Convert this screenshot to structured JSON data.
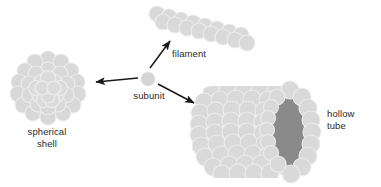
{
  "figure": {
    "background_color": "#ffffff",
    "subunit_fill": "#d9d9d9",
    "subunit_stroke": "#e9e9e9",
    "tube_interior_color": "#8a8a8a",
    "arrow_color": "#1a1a1a",
    "text_color": "#2b2b2b"
  },
  "labels": {
    "spherical_shell": "spherical\nshell",
    "filament": "filament",
    "subunit": "subunit",
    "hollow_tube": "hollow\ntube"
  },
  "structures": {
    "subunit": {
      "name": "subunit",
      "shape": "single circle",
      "center": [
        148,
        79
      ],
      "radius": 7
    },
    "spherical_shell": {
      "name": "spherical shell",
      "shape": "dense sphere cluster of circles",
      "center": [
        48,
        88
      ],
      "radius": 31,
      "subunit_count": 37
    },
    "filament": {
      "name": "filament",
      "shape": "staggered double-row diagonal chain",
      "start": [
        157,
        14
      ],
      "end": [
        247,
        42
      ],
      "subunit_count": 16
    },
    "hollow_tube": {
      "name": "hollow tube",
      "shape": "cylinder of circles with open dark end",
      "bounds": [
        198,
        86,
        122,
        92
      ],
      "subunit_count": 60
    }
  },
  "arrows": [
    {
      "name": "arrow-to-spherical-shell",
      "from": [
        138,
        78
      ],
      "to": [
        94,
        82
      ],
      "points_to": "spherical shell"
    },
    {
      "name": "arrow-to-filament",
      "from": [
        150,
        68
      ],
      "to": [
        170,
        40
      ],
      "points_to": "filament"
    },
    {
      "name": "arrow-to-hollow-tube",
      "from": [
        158,
        84
      ],
      "to": [
        196,
        104
      ],
      "points_to": "hollow tube"
    }
  ]
}
